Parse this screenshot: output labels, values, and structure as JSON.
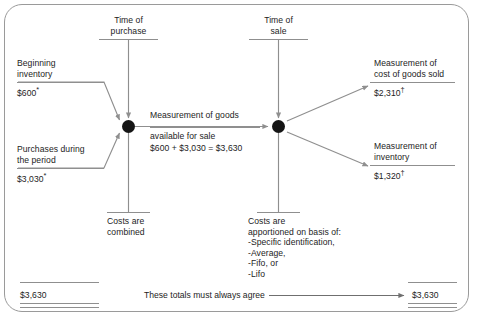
{
  "diagram": {
    "timeline": {
      "purchase": {
        "line1": "Time of",
        "line2": "purchase"
      },
      "sale": {
        "line1": "Time of",
        "line2": "sale"
      }
    },
    "inputs": [
      {
        "name": "beginning-inventory",
        "line1": "Beginning",
        "line2": "inventory",
        "amount": "$600",
        "footnote": "*"
      },
      {
        "name": "purchases-during-period",
        "line1": "Purchases during",
        "line2": "the period",
        "amount": "$3,030",
        "footnote": "*"
      }
    ],
    "center": {
      "name": "goods-available-for-sale",
      "line1": "Measurement of goods",
      "line2": "available for sale",
      "equation": "$600 + $3,030 = $3,630"
    },
    "outputs": [
      {
        "name": "cost-of-goods-sold",
        "line1": "Measurement of",
        "line2": "cost of goods sold",
        "amount": "$2,310",
        "footnote": "†"
      },
      {
        "name": "ending-inventory",
        "line1": "Measurement of",
        "line2": "inventory",
        "amount": "$1,320",
        "footnote": "†"
      }
    ],
    "notes": {
      "combined": {
        "line1": "Costs are",
        "line2": "combined"
      },
      "apportioned": {
        "line1": "Costs are",
        "line2": "apportioned on basis of:",
        "methods": [
          "-Specific identification,",
          "-Average,",
          "-Fifo, or",
          "-Lifo"
        ]
      }
    },
    "totals": {
      "left": "$3,630",
      "right": "$3,630",
      "caption": "These totals must always agree"
    },
    "colors": {
      "ink": "#1d1d1d",
      "rule": "#8f8f8f",
      "node": "#151515",
      "frame": "#9a9a9a",
      "background": "#ffffff"
    }
  }
}
